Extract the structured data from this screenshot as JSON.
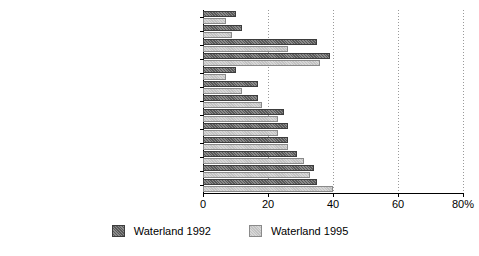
{
  "chart_data": {
    "type": "bar",
    "orientation": "horizontal",
    "title": "",
    "xlabel": "",
    "ylabel": "",
    "xlim": [
      0,
      80
    ],
    "xticks": [
      0,
      20,
      40,
      60,
      80
    ],
    "xtick_labels": [
      "0",
      "20",
      "40",
      "60",
      "80%"
    ],
    "grid": true,
    "legend_position": "bottom-center",
    "categories": [
      "job content",
      "emotional stress",
      "appreciation reward and prospects",
      "physical load",
      "emotional exhaustion",
      "health complaints",
      "supervision and co-workers",
      "physical working conditions",
      "organisation of work",
      "sickness behaviour",
      "autonomy",
      "psychological and physical effort",
      "workpace"
    ],
    "category_markers": [
      "arrow",
      "arrow",
      "arrow",
      "none",
      "none",
      "none",
      "none",
      "none",
      "none",
      "none",
      "none",
      "none",
      "arrow"
    ],
    "series": [
      {
        "name": "Waterland 1992",
        "color": "#5a5a5a",
        "values": [
          10,
          12,
          35,
          39,
          10,
          17,
          17,
          25,
          26,
          26,
          29,
          34,
          35
        ]
      },
      {
        "name": "Waterland 1995",
        "color": "#c2c2c2",
        "values": [
          7,
          9,
          26,
          36,
          7,
          12,
          18,
          23,
          23,
          26,
          31,
          33,
          40
        ]
      }
    ]
  },
  "legend": {
    "items": [
      {
        "label": "Waterland 1992"
      },
      {
        "label": "Waterland 1995"
      }
    ]
  }
}
